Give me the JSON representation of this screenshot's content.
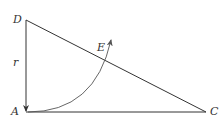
{
  "diagram": {
    "type": "geometry-right-triangle",
    "colors": {
      "stroke": "#333333",
      "arc": "#555555",
      "background": "#ffffff"
    },
    "points": {
      "D": {
        "label": "D",
        "x": 26,
        "y": 20
      },
      "A": {
        "label": "A",
        "x": 26,
        "y": 112
      },
      "C": {
        "label": "C",
        "x": 206,
        "y": 112
      },
      "E": {
        "label": "E"
      }
    },
    "segment_labels": {
      "DA": "r"
    },
    "edges": [
      "D-A",
      "A-C",
      "D-C"
    ],
    "arc": {
      "from": "A",
      "to": "E",
      "direction": "counterclockwise-up",
      "arrow": true
    },
    "arrow_on_DA": {
      "direction": "down",
      "towards": "A"
    }
  }
}
